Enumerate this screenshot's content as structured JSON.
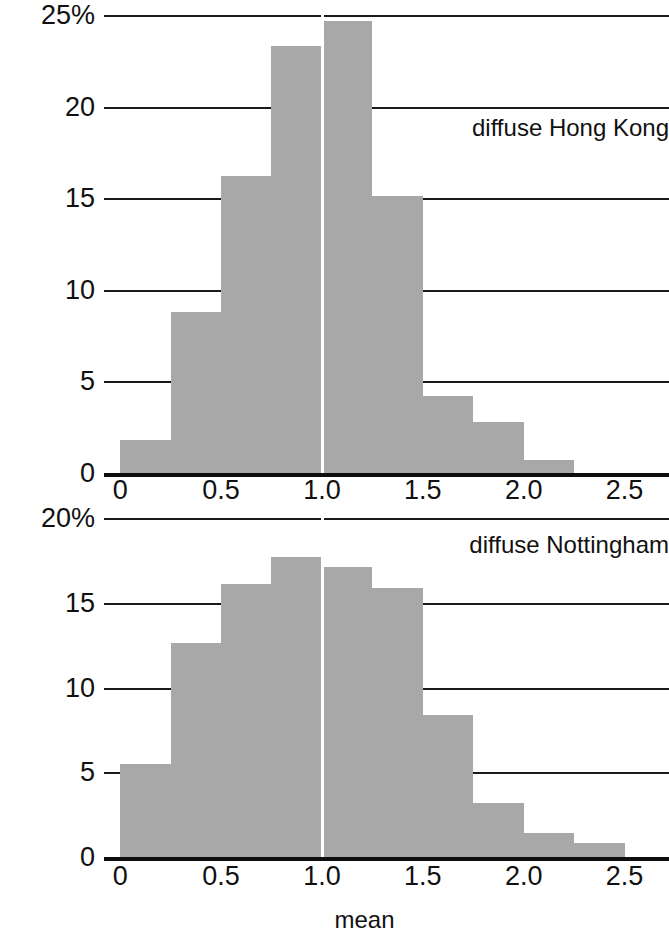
{
  "axis_label": "mean",
  "panels": [
    {
      "name": "diffuse Hong Kong",
      "ylabel_top": "25%",
      "yticks": [
        "25%",
        "20",
        "15",
        "10",
        "5",
        "0"
      ],
      "xticks": [
        "0",
        "0.5",
        "1.0",
        "1.5",
        "2.0",
        "2.5"
      ]
    },
    {
      "name": "diffuse Nottingham",
      "ylabel_top": "20%",
      "yticks": [
        "20%",
        "15",
        "10",
        "5",
        "0"
      ],
      "xticks": [
        "0",
        "0.5",
        "1.0",
        "1.5",
        "2.0",
        "2.5"
      ]
    }
  ],
  "chart_data": [
    {
      "type": "bar",
      "title": "diffuse Hong Kong",
      "xlabel": "",
      "ylabel": "",
      "ylim": [
        0,
        25
      ],
      "xlim": [
        -0.08,
        2.72
      ],
      "grid": true,
      "yticks": [
        0,
        5,
        10,
        15,
        20,
        25
      ],
      "ytick_labels": [
        "0",
        "5",
        "10",
        "15",
        "20",
        "25%"
      ],
      "xticks": [
        0,
        0.5,
        1.0,
        1.5,
        2.0,
        2.5
      ],
      "xtick_labels": [
        "0",
        "0.5",
        "1.0",
        "1.5",
        "2.0",
        "2.5"
      ],
      "bin_width": 0.25,
      "bin_edges": [
        0,
        0.25,
        0.5,
        0.75,
        1.0,
        1.25,
        1.5,
        1.75,
        2.0,
        2.25
      ],
      "bin_centers": [
        0.125,
        0.375,
        0.625,
        0.875,
        1.125,
        1.375,
        1.625,
        1.875,
        2.125
      ],
      "values": [
        1.8,
        8.8,
        16.2,
        23.3,
        24.7,
        15.1,
        4.2,
        2.8,
        0.7
      ],
      "units": "percent",
      "reference_line_x": 1.0,
      "bar_color": "#a8a8a8"
    },
    {
      "type": "bar",
      "title": "diffuse Nottingham",
      "xlabel": "mean",
      "ylabel": "",
      "ylim": [
        0,
        20
      ],
      "xlim": [
        -0.08,
        2.72
      ],
      "grid": true,
      "yticks": [
        0,
        5,
        10,
        15,
        20
      ],
      "ytick_labels": [
        "0",
        "5",
        "10",
        "15",
        "20%"
      ],
      "xticks": [
        0,
        0.5,
        1.0,
        1.5,
        2.0,
        2.5
      ],
      "xtick_labels": [
        "0",
        "0.5",
        "1.0",
        "1.5",
        "2.0",
        "2.5"
      ],
      "bin_width": 0.25,
      "bin_edges": [
        0,
        0.25,
        0.5,
        0.75,
        1.0,
        1.25,
        1.5,
        1.75,
        2.0,
        2.25,
        2.5
      ],
      "bin_centers": [
        0.125,
        0.375,
        0.625,
        0.875,
        1.125,
        1.375,
        1.625,
        1.875,
        2.125,
        2.375
      ],
      "values": [
        5.5,
        12.6,
        16.1,
        17.7,
        17.1,
        15.9,
        8.4,
        3.2,
        1.4,
        0.8
      ],
      "units": "percent",
      "reference_line_x": 1.0,
      "bar_color": "#a8a8a8"
    }
  ]
}
